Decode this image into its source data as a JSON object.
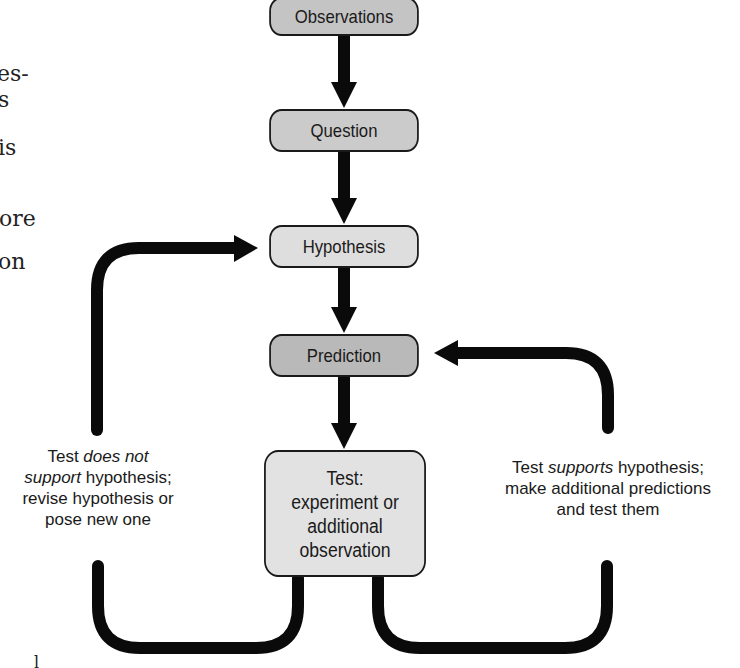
{
  "diagram": {
    "type": "flowchart",
    "nodes": [
      {
        "id": "observations",
        "label": "Observations",
        "fill": "#c4c4c4"
      },
      {
        "id": "question",
        "label": "Question",
        "fill": "#cbcbcb"
      },
      {
        "id": "hypothesis",
        "label": "Hypothesis",
        "fill": "#dedede"
      },
      {
        "id": "prediction",
        "label": "Prediction",
        "fill": "#b9b9b9"
      },
      {
        "id": "test",
        "label_lines": [
          "Test:",
          "experiment or",
          "additional",
          "observation"
        ],
        "fill": "#e2e2e2"
      }
    ],
    "edges": [
      {
        "from": "observations",
        "to": "question"
      },
      {
        "from": "question",
        "to": "hypothesis"
      },
      {
        "from": "hypothesis",
        "to": "prediction"
      },
      {
        "from": "prediction",
        "to": "test"
      },
      {
        "from": "test",
        "to": "hypothesis",
        "label": "Test does not support hypothesis; revise hypothesis or pose new one"
      },
      {
        "from": "test",
        "to": "prediction",
        "label": "Test supports hypothesis; make additional predictions and test them"
      }
    ],
    "left_label": {
      "line1_a": "Test ",
      "line1_b": "does not",
      "line2_a": "support",
      "line2_b": " hypothesis;",
      "line3": "revise hypothesis or",
      "line4": "pose new one"
    },
    "right_label": {
      "line1_a": "Test ",
      "line1_b": "supports",
      "line1_c": " hypothesis;",
      "line2": "make additional predictions",
      "line3": "and test them"
    }
  },
  "background_text_fragments": [
    "es-",
    "s",
    ".",
    "is",
    ".",
    "ore",
    ".",
    "on",
    "l"
  ],
  "colors": {
    "arrow": "#0a0a0a",
    "border": "#1a1a1a",
    "text": "#1a1a1a",
    "background": "#ffffff"
  }
}
